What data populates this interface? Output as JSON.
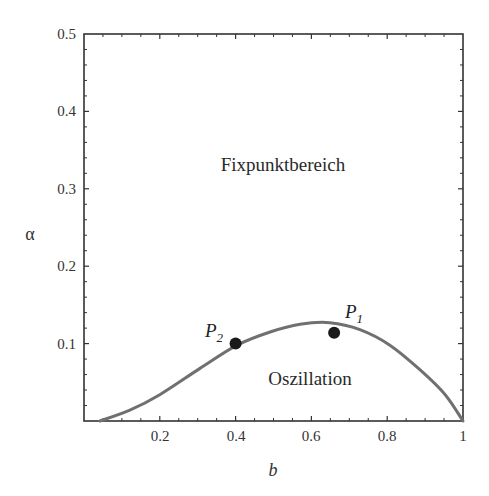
{
  "chart_data": {
    "type": "line",
    "title": "",
    "xlabel": "b",
    "ylabel": "α",
    "xlim": [
      0,
      1
    ],
    "ylim": [
      0,
      0.5
    ],
    "grid": false,
    "x_ticks": [
      "0.2",
      "0.4",
      "0.6",
      "0.8",
      "1"
    ],
    "y_ticks": [
      "0.1",
      "0.2",
      "0.3",
      "0.4",
      "0.5"
    ],
    "series": [
      {
        "name": "Stabilitätsgrenze",
        "color": "#707070",
        "x": [
          0.042,
          0.121,
          0.2,
          0.306,
          0.404,
          0.491,
          0.57,
          0.649,
          0.728,
          0.807,
          0.887,
          0.953,
          1.0
        ],
        "y": [
          0.0,
          0.014,
          0.034,
          0.068,
          0.098,
          0.115,
          0.125,
          0.127,
          0.118,
          0.098,
          0.066,
          0.034,
          0.0
        ]
      }
    ],
    "points": [
      {
        "label": "P",
        "subscript": "1",
        "x": 0.66,
        "y": 0.114
      },
      {
        "label": "P",
        "subscript": "2",
        "x": 0.4,
        "y": 0.1
      }
    ],
    "annotations": [
      {
        "text": "Fixpunktbereich",
        "x": 0.5,
        "y": 0.32
      },
      {
        "text": "Oszillation",
        "x": 0.6,
        "y": 0.045
      }
    ]
  },
  "labels": {
    "xlabel": "b",
    "ylabel": "α",
    "region_top": "Fixpunktbereich",
    "region_bottom": "Oszillation",
    "p1": "P",
    "p1_sub": "1",
    "p2": "P",
    "p2_sub": "2",
    "x_ticks": [
      "0.2",
      "0.4",
      "0.6",
      "0.8",
      "1"
    ],
    "y_ticks": [
      "0.1",
      "0.2",
      "0.3",
      "0.4",
      "0.5"
    ]
  }
}
